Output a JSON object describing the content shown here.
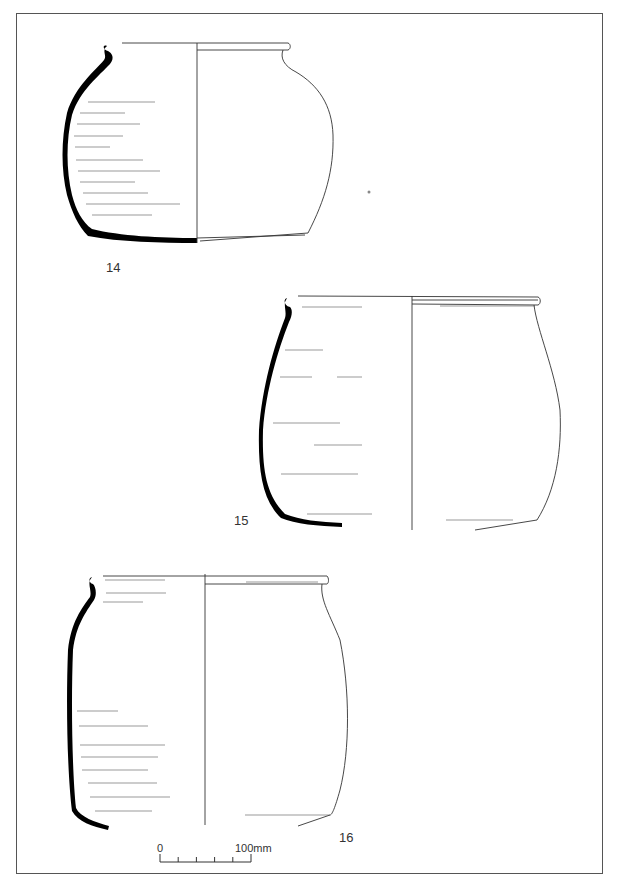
{
  "figure": {
    "vessels": [
      {
        "id": "vessel-14",
        "label": "14"
      },
      {
        "id": "vessel-15",
        "label": "15"
      },
      {
        "id": "vessel-16",
        "label": "16"
      }
    ],
    "scale_bar": {
      "start_label": "0",
      "end_label": "100mm",
      "divisions": 5
    },
    "colors": {
      "section_fill": "#000000",
      "line": "#333333",
      "frame": "#555555"
    }
  }
}
